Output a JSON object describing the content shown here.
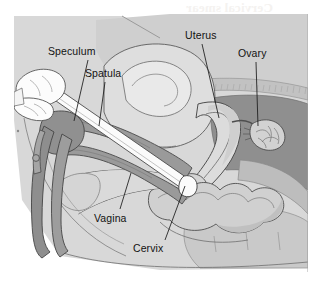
{
  "figure": {
    "ghost_text": "Cervical smear",
    "panel": {
      "background_color": "#d9d9d9",
      "border_color": "#9a9a9a"
    }
  },
  "palette": {
    "page_white": "#ffffff",
    "body_light": "#dcdcdc",
    "body_mid": "#c6c6c6",
    "muscle_dark": "#9b9b9b",
    "muscle_darker": "#8a8a8a",
    "organ_pale": "#e6e6e6",
    "organ_white": "#f2f2f2",
    "instrument_gray": "#9d9d9d",
    "instrument_shadow": "#7e7e7e",
    "outline": "#3a3a3a",
    "outline_soft": "#6e6e6e",
    "label_text": "#121212",
    "leader_line": "#1a1a1a"
  },
  "labels": [
    {
      "id": "speculum",
      "text": "Speculum",
      "x": 48,
      "y": 46,
      "leader": {
        "x1": 88,
        "y1": 60,
        "x2": 74,
        "y2": 121
      }
    },
    {
      "id": "spatula",
      "text": "Spatula",
      "x": 85,
      "y": 68,
      "leader": {
        "x1": 105,
        "y1": 82,
        "x2": 99,
        "y2": 126
      }
    },
    {
      "id": "uterus",
      "text": "Uterus",
      "x": 185,
      "y": 30,
      "leader": {
        "x1": 202,
        "y1": 44,
        "x2": 219,
        "y2": 118
      }
    },
    {
      "id": "ovary",
      "text": "Ovary",
      "x": 238,
      "y": 48,
      "leader": {
        "x1": 256,
        "y1": 62,
        "x2": 258,
        "y2": 126
      }
    },
    {
      "id": "vagina",
      "text": "Vagina",
      "x": 94,
      "y": 213,
      "leader": {
        "x1": 120,
        "y1": 209,
        "x2": 131,
        "y2": 173
      }
    },
    {
      "id": "cervix",
      "text": "Cervix",
      "x": 133,
      "y": 243,
      "leader": {
        "x1": 165,
        "y1": 240,
        "x2": 185,
        "y2": 186
      }
    }
  ]
}
